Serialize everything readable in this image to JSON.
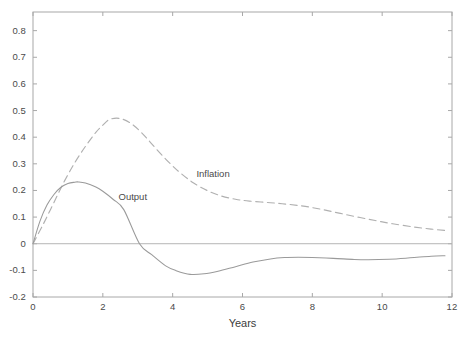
{
  "chart_data": {
    "type": "line",
    "title": "",
    "subtitle": "",
    "xlabel": "Years",
    "ylabel": "",
    "xlim": [
      0,
      12
    ],
    "ylim": [
      -0.2,
      0.87
    ],
    "xticks": [
      0,
      2,
      4,
      6,
      8,
      10,
      12
    ],
    "xtick_labels": [
      "0",
      "2",
      "4",
      "6",
      "8",
      "10",
      "12"
    ],
    "yticks": [
      -0.2,
      -0.1,
      0,
      0.1,
      0.2,
      0.3,
      0.4,
      0.5,
      0.6,
      0.7,
      0.8
    ],
    "ytick_labels": [
      "-0.2",
      "-0.1",
      "0",
      "0.1",
      "0.2",
      "0.3",
      "0.4",
      "0.5",
      "0.6",
      "0.7",
      "0.8"
    ],
    "grid": false,
    "legend_position": "inline-annotations",
    "zero_line": 0,
    "series": [
      {
        "name": "Output",
        "style": "solid",
        "color": "#9a9a9a",
        "annotation_label": "Output",
        "x": [
          0,
          0.2,
          0.4,
          0.6,
          0.8,
          1.0,
          1.2,
          1.3,
          1.5,
          1.8,
          2.0,
          2.3,
          2.6,
          3.05,
          3.4,
          3.8,
          4.1,
          4.5,
          4.9,
          5.3,
          5.8,
          6.3,
          6.8,
          7.2,
          7.6,
          8.0,
          8.6,
          9.2,
          9.6,
          10.2,
          10.8,
          11.4,
          11.8
        ],
        "y": [
          0.0,
          0.085,
          0.145,
          0.185,
          0.212,
          0.226,
          0.231,
          0.232,
          0.228,
          0.213,
          0.197,
          0.166,
          0.128,
          0.0,
          -0.041,
          -0.083,
          -0.101,
          -0.115,
          -0.113,
          -0.103,
          -0.086,
          -0.069,
          -0.057,
          -0.052,
          -0.051,
          -0.052,
          -0.055,
          -0.059,
          -0.06,
          -0.058,
          -0.053,
          -0.047,
          -0.045
        ]
      },
      {
        "name": "Inflation",
        "style": "dashed",
        "color": "#b0b0b0",
        "annotation_label": "Inflation",
        "x": [
          0,
          0.3,
          0.6,
          0.9,
          1.2,
          1.5,
          1.8,
          2.0,
          2.2,
          2.5,
          2.8,
          3.1,
          3.4,
          3.8,
          4.2,
          4.6,
          5.0,
          5.4,
          5.8,
          6.2,
          6.8,
          7.3,
          7.8,
          8.3,
          8.8,
          9.3,
          9.8,
          10.3,
          10.9,
          11.4,
          11.8
        ],
        "y": [
          0.0,
          0.075,
          0.155,
          0.235,
          0.305,
          0.365,
          0.418,
          0.445,
          0.467,
          0.47,
          0.452,
          0.418,
          0.375,
          0.318,
          0.268,
          0.228,
          0.199,
          0.179,
          0.167,
          0.16,
          0.154,
          0.148,
          0.14,
          0.128,
          0.114,
          0.1,
          0.087,
          0.075,
          0.063,
          0.055,
          0.05
        ]
      }
    ],
    "annotations": [
      {
        "text": "Output",
        "x": 2.45,
        "y": 0.175
      },
      {
        "text": "Inflation",
        "x": 4.68,
        "y": 0.262
      }
    ]
  },
  "axes": {
    "x_title": "Years"
  },
  "style": {
    "axis_color": "#a8a8a8",
    "text_color": "#4a4a4a",
    "output_color": "#9a9a9a",
    "inflation_color": "#b0b0b0",
    "zero_line_color": "#b5b5b5",
    "background": "#ffffff"
  }
}
